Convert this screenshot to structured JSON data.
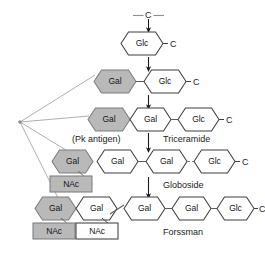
{
  "figure": {
    "background": "#ffffff",
    "colors": {
      "shaded_fill": "#b9b9b9",
      "plain_fill": "#ffffff",
      "stroke": "#3a3a3a",
      "fan_line": "#9a9a9a",
      "text": "#1a1a1a"
    },
    "precursor": {
      "label": "C",
      "left_dash": "—",
      "right_dash": "—"
    },
    "ceramide_marks": [
      {
        "id": "cer-row-1",
        "label": "C"
      },
      {
        "id": "cer-row-2",
        "label": "C"
      },
      {
        "id": "cer-row-3",
        "label": "C"
      },
      {
        "id": "cer-row-4",
        "label": "C"
      },
      {
        "id": "cer-row-5",
        "label": "C"
      }
    ],
    "rows": [
      {
        "id": "row-glucosylceramide",
        "caption": "",
        "sugars": [
          {
            "id": "r1-glc",
            "label": "Glc",
            "fill": "plain",
            "shape": "hexagon"
          }
        ],
        "branches": []
      },
      {
        "id": "row-lactosylceramide",
        "caption": "",
        "sugars": [
          {
            "id": "r2-gal",
            "label": "Gal",
            "fill": "shaded",
            "shape": "hexagon"
          },
          {
            "id": "r2-glc",
            "label": "Glc",
            "fill": "plain",
            "shape": "hexagon"
          }
        ],
        "branches": []
      },
      {
        "id": "row-pk-antigen",
        "caption": "(Pk antigen)",
        "caption_right": "Triceramide",
        "sugars": [
          {
            "id": "r3-gal-shaded",
            "label": "Gal",
            "fill": "shaded",
            "shape": "hexagon"
          },
          {
            "id": "r3-gal",
            "label": "Gal",
            "fill": "plain",
            "shape": "hexagon"
          },
          {
            "id": "r3-glc",
            "label": "Glc",
            "fill": "plain",
            "shape": "hexagon"
          }
        ],
        "branches": []
      },
      {
        "id": "row-globoside",
        "caption_right": "Globoside",
        "sugars": [
          {
            "id": "r4-gal-shaded",
            "label": "Gal",
            "fill": "shaded",
            "shape": "hexagon"
          },
          {
            "id": "r4-gal-a",
            "label": "Gal",
            "fill": "plain",
            "shape": "hexagon"
          },
          {
            "id": "r4-gal-b",
            "label": "Gal",
            "fill": "plain",
            "shape": "hexagon"
          },
          {
            "id": "r4-glc",
            "label": "Glc",
            "fill": "plain",
            "shape": "hexagon"
          }
        ],
        "branches": [
          {
            "id": "r4-nac",
            "label": "NAc",
            "fill": "shaded",
            "shape": "box"
          }
        ]
      },
      {
        "id": "row-forssman",
        "caption_right": "Forssman",
        "sugars": [
          {
            "id": "r5-gal-shaded",
            "label": "Gal",
            "fill": "shaded",
            "shape": "hexagon"
          },
          {
            "id": "r5-gal-a",
            "label": "Gal",
            "fill": "plain",
            "shape": "hexagon"
          },
          {
            "id": "r5-gal-b",
            "label": "Gal",
            "fill": "plain",
            "shape": "hexagon"
          },
          {
            "id": "r5-gal-c",
            "label": "Gal",
            "fill": "plain",
            "shape": "hexagon"
          },
          {
            "id": "r5-glc",
            "label": "Glc",
            "fill": "plain",
            "shape": "hexagon"
          }
        ],
        "branches": [
          {
            "id": "r5-nac-shaded",
            "label": "NAc",
            "fill": "shaded",
            "shape": "box"
          },
          {
            "id": "r5-nac-plain",
            "label": "NAc",
            "fill": "plain",
            "shape": "box"
          }
        ]
      }
    ],
    "donor_hub": {
      "id": "donor-hub",
      "label": ""
    }
  }
}
